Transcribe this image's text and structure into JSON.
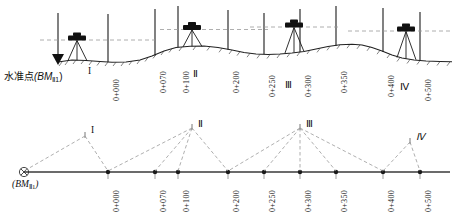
{
  "figure": {
    "title_top": "",
    "title_bottom": "",
    "benchmark_label_cn": "水准点",
    "benchmark_symbol_top": "(BM",
    "benchmark_subscript": "Ⅱ1",
    "benchmark_close": ")",
    "benchmark_label_bottom": "(BM",
    "stations": [
      {
        "name": "I",
        "x_top": 77,
        "x_bottom": 85,
        "label": "I"
      },
      {
        "name": "II",
        "x_top": 192,
        "x_bottom": 192,
        "label": "Ⅱ"
      },
      {
        "name": "III",
        "x_top": 294,
        "x_bottom": 300,
        "label": "Ⅲ"
      },
      {
        "name": "IV",
        "x_top": 406,
        "x_bottom": 410,
        "label": "Ⅳ"
      }
    ],
    "chainages": [
      {
        "label": "0+000",
        "x": 108
      },
      {
        "label": "0+070",
        "x": 155
      },
      {
        "label": "0+100",
        "x": 178
      },
      {
        "label": "0+200",
        "x": 228
      },
      {
        "label": "0+250",
        "x": 264
      },
      {
        "label": "0+300",
        "x": 300
      },
      {
        "label": "0+350",
        "x": 336
      },
      {
        "label": "0+400",
        "x": 383
      },
      {
        "label": "0+500",
        "x": 420
      }
    ],
    "colors": {
      "ink": "#1a1a1a",
      "ground": "#2b2b2b",
      "dashed": "#8a8a8a",
      "instrument_body": "#111111",
      "axis": "#333333"
    },
    "caption_notes": {
      "upper_view": "纵断面水准测量示意图",
      "lower_view": "水准路线平面示意图"
    }
  }
}
